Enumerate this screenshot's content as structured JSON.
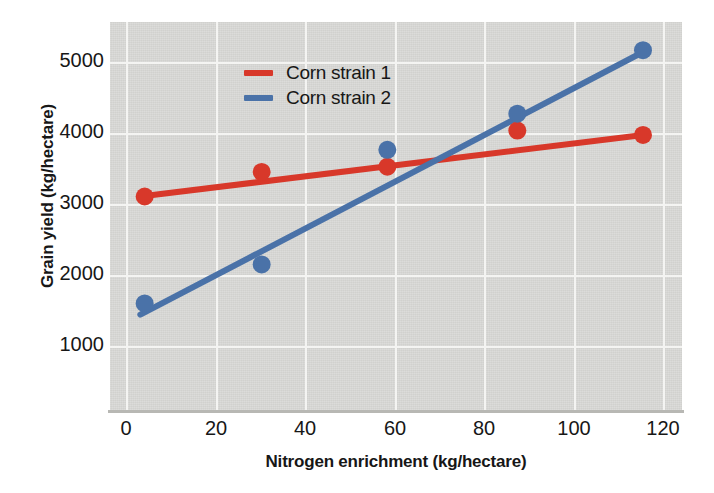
{
  "chart_data": {
    "type": "scatter",
    "title": "",
    "subtitle": "",
    "xlabel": "Nitrogen enrichment (kg/hectare)",
    "ylabel": "Grain yield (kg/hectare)",
    "xlim": [
      -4,
      128
    ],
    "ylim": [
      430,
      5280
    ],
    "xticks": [
      0,
      20,
      40,
      60,
      80,
      100,
      120
    ],
    "yticks": [
      1000,
      2000,
      3000,
      4000,
      5000
    ],
    "xtick_labels": [
      "0",
      "20",
      "40",
      "60",
      "80",
      "100",
      "120"
    ],
    "ytick_labels": [
      "1000",
      "2000",
      "3000",
      "4000",
      "5000"
    ],
    "grid": true,
    "grid_color": "#f4f4f2",
    "plot_background": "#d6d6d3",
    "legend_position": "upper left",
    "series": [
      {
        "name": "Corn strain 1",
        "color": "#d8382a",
        "marker": "circle",
        "trendline": true,
        "x": [
          4,
          31,
          60,
          90,
          119
        ],
        "y": [
          3110,
          3415,
          3480,
          3930,
          3875
        ],
        "fit_endpoints": {
          "x": [
            3,
            120
          ],
          "y": [
            3110,
            3880
          ]
        }
      },
      {
        "name": "Corn strain 2",
        "color": "#4a72a8",
        "marker": "circle",
        "trendline": true,
        "x": [
          4,
          31,
          60,
          90,
          119
        ],
        "y": [
          1780,
          2265,
          3690,
          4140,
          4930
        ],
        "fit_endpoints": {
          "x": [
            3,
            120
          ],
          "y": [
            1640,
            4935
          ]
        }
      }
    ]
  },
  "legend": {
    "entries": [
      {
        "label": "Corn strain 1",
        "color": "#d8382a"
      },
      {
        "label": "Corn strain 2",
        "color": "#4a72a8"
      }
    ]
  }
}
